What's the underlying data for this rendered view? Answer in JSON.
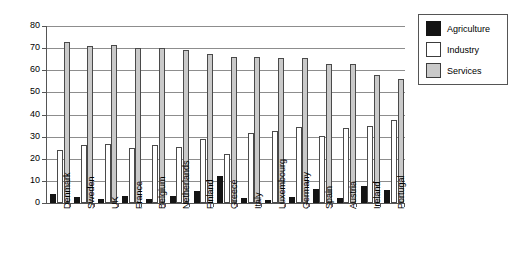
{
  "chart_data": {
    "type": "bar",
    "title": "",
    "xlabel": "",
    "ylabel": "",
    "ylim": [
      0,
      80
    ],
    "yticks": [
      0,
      10,
      20,
      30,
      40,
      50,
      60,
      70,
      80
    ],
    "grid": true,
    "legend_position": "right",
    "categories": [
      "Denmark",
      "Sweden",
      "UK",
      "France",
      "Belgium",
      "Netherlands",
      "Finland",
      "Greece",
      "Italy",
      "Luxembourg",
      "Germany",
      "Spain",
      "Austria",
      "Ireland",
      "Portugal"
    ],
    "series": [
      {
        "name": "Agriculture",
        "color": "#141414",
        "values": [
          4.0,
          2.5,
          1.8,
          3.0,
          2.0,
          3.2,
          5.5,
          12.0,
          2.3,
          1.5,
          2.6,
          6.5,
          2.4,
          7.8,
          6.0
        ]
      },
      {
        "name": "Industry",
        "color": "#ffffff",
        "values": [
          23.8,
          26.0,
          26.5,
          24.8,
          26.0,
          25.5,
          28.8,
          22.0,
          31.5,
          32.5,
          34.5,
          30.5,
          33.8,
          35.0,
          37.5
        ]
      },
      {
        "name": "Services",
        "color": "#c9c9c9",
        "values": [
          73.0,
          71.0,
          71.3,
          70.2,
          70.2,
          69.2,
          67.5,
          66.0,
          66.2,
          65.5,
          65.5,
          63.0,
          62.8,
          58.0,
          56.2
        ]
      }
    ]
  },
  "legend": {
    "items": [
      {
        "label": "Agriculture",
        "swatch": "agriculture"
      },
      {
        "label": "Industry",
        "swatch": "industry"
      },
      {
        "label": "Services",
        "swatch": "services"
      }
    ]
  }
}
